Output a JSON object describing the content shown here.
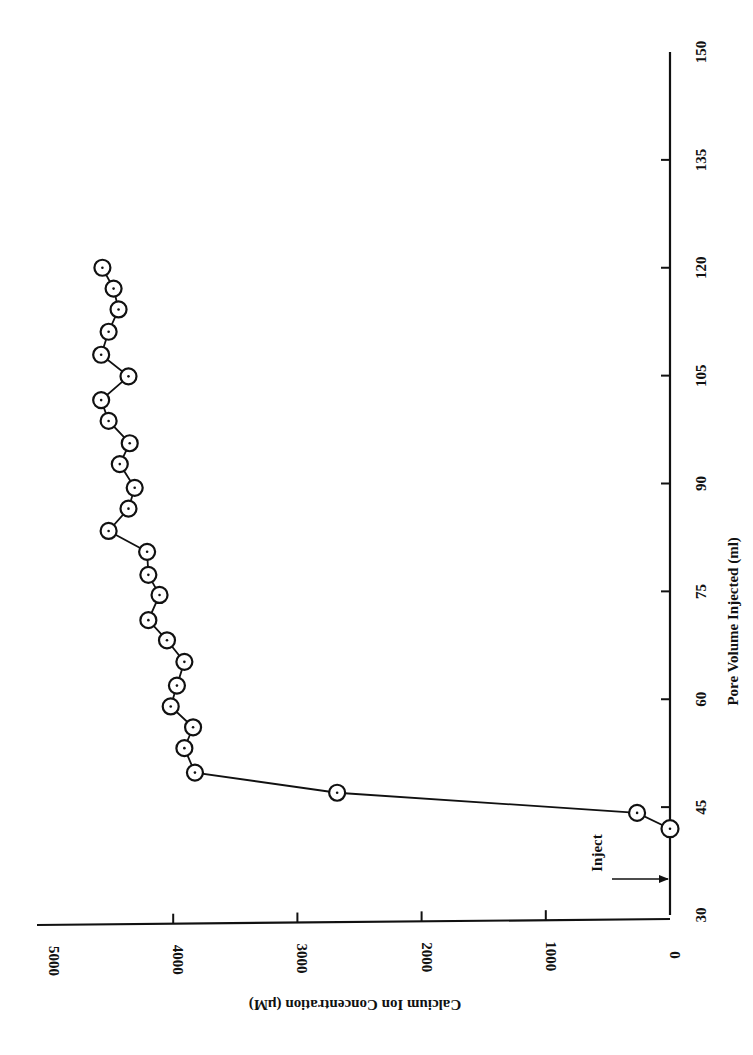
{
  "chart_data": {
    "type": "line",
    "title": "",
    "orientation_note": "rotated 90 degrees on page",
    "xlabel": "Pore Volume Injected (ml)",
    "ylabel": "Calcium Ion Concentration (µM)",
    "xlim": [
      30,
      150
    ],
    "ylim": [
      0,
      5000
    ],
    "xticks": [
      30,
      45,
      60,
      75,
      90,
      105,
      120,
      135,
      150
    ],
    "yticks": [
      0,
      1000,
      2000,
      3000,
      4000,
      5000
    ],
    "grid": false,
    "legend": null,
    "marker": "circle-with-dot",
    "annotations": [
      {
        "text": "Inject",
        "x": 35,
        "y": 0,
        "type": "arrow"
      }
    ],
    "series": [
      {
        "name": "Calcium Ion Concentration",
        "x": [
          42,
          44.2,
          47,
          49.8,
          53.2,
          56.1,
          59,
          61.9,
          65.2,
          68.2,
          71,
          74.5,
          77.3,
          80.5,
          83.4,
          86.5,
          89.4,
          92.7,
          95.6,
          98.7,
          101.6,
          104.9,
          107.9,
          111.1,
          114.2,
          117.1,
          120
        ],
        "values": [
          0,
          265,
          2680,
          3825,
          3910,
          3840,
          4020,
          3970,
          3910,
          4050,
          4200,
          4110,
          4200,
          4210,
          4520,
          4360,
          4310,
          4430,
          4350,
          4520,
          4580,
          4360,
          4580,
          4520,
          4440,
          4480,
          4570
        ]
      }
    ]
  },
  "labels": {
    "xlabel": "Pore Volume Injected (ml)",
    "ylabel": "Calcium Ion Concentration (µM)",
    "inject": "Inject",
    "xticks": [
      "30",
      "45",
      "60",
      "75",
      "90",
      "105",
      "120",
      "135",
      "150"
    ],
    "yticks": [
      "0",
      "1000",
      "2000",
      "3000",
      "4000",
      "5000"
    ]
  }
}
